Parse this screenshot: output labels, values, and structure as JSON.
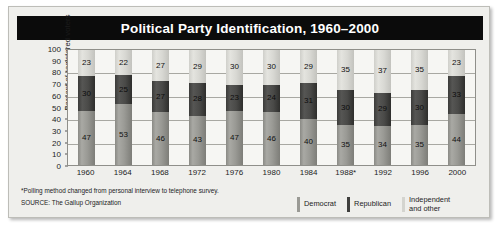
{
  "chart_data": {
    "type": "bar",
    "subtype": "stacked-column-100",
    "title": "Political Party Identification, 1960–2000",
    "xlabel": "",
    "ylabel": "Percent of registered voters",
    "ylim": [
      0,
      100
    ],
    "ytick_labels": [
      "100",
      "90",
      "80",
      "70",
      "60",
      "50",
      "40",
      "30",
      "20",
      "10",
      "0"
    ],
    "ytick_values": [
      100,
      90,
      80,
      70,
      60,
      50,
      40,
      30,
      20,
      10,
      0
    ],
    "gridlines_at": [
      100,
      80,
      60,
      40,
      20,
      0
    ],
    "grid": true,
    "legend_position": "bottom-right",
    "categories": [
      "1960",
      "1964",
      "1968",
      "1972",
      "1976",
      "1980",
      "1984",
      "1988*",
      "1992",
      "1996",
      "2000"
    ],
    "series": [
      {
        "name": "Democrat",
        "color": "#9a9a95",
        "values": [
          47,
          53,
          46,
          43,
          47,
          46,
          40,
          35,
          34,
          35,
          44
        ]
      },
      {
        "name": "Republican",
        "color": "#3f3f3d",
        "values": [
          30,
          25,
          27,
          28,
          23,
          24,
          31,
          30,
          29,
          30,
          33
        ]
      },
      {
        "name": "Independent and other",
        "color": "#d4d4cf",
        "values": [
          23,
          22,
          27,
          29,
          30,
          30,
          29,
          35,
          37,
          35,
          23
        ]
      }
    ],
    "annotations": [
      "*Polling method changed from personal interview to telephone survey.",
      "SOURCE: The Gallup Organization"
    ]
  },
  "header": {
    "title": "Political Party Identification, 1960–2000"
  },
  "axes": {
    "y_title": "Percent of registered voters",
    "y_ticks": [
      "100",
      "90",
      "80",
      "70",
      "60",
      "50",
      "40",
      "30",
      "20",
      "10",
      "0"
    ],
    "x_ticks": [
      "1960",
      "1964",
      "1968",
      "1972",
      "1976",
      "1980",
      "1984",
      "1988*",
      "1992",
      "1996",
      "2000"
    ]
  },
  "legend": {
    "items": [
      {
        "label": "Democrat",
        "color": "#9a9a95"
      },
      {
        "label": "Republican",
        "color": "#3f3f3d"
      },
      {
        "label": "Independent and other",
        "color": "#d4d4cf"
      }
    ]
  },
  "footnotes": {
    "method_note": "*Polling method changed from personal interview to telephone survey.",
    "source": "SOURCE: The Gallup Organization"
  }
}
